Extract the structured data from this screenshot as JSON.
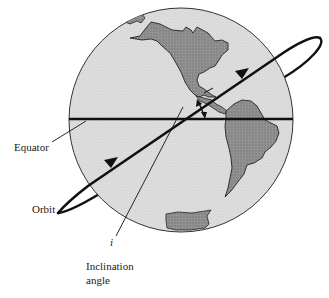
{
  "figure": {
    "type": "diagram",
    "labels": {
      "equator": "Equator",
      "orbit": "Orbit",
      "inclination_symbol": "i",
      "inclination_line1": "Inclination",
      "inclination_line2": "angle"
    },
    "caption": {
      "text": "",
      "note": "caption cut off at bottom edge, illegible"
    },
    "colors": {
      "background": "#ffffff",
      "globe_fill": "#dcdcdc",
      "land_fill": "#8a8a8a",
      "line": "#111111"
    },
    "elements": {
      "globe": {
        "cx": 181,
        "cy": 120,
        "r": 112
      },
      "equator_line": {
        "x1": 69,
        "y1": 119,
        "x2": 293,
        "y2": 119
      },
      "orbit_ellipse": {
        "cx": 189,
        "cy": 126,
        "rx": 158,
        "ry": 14,
        "rotation_deg": -33.7
      },
      "orbit_direction_arrows": 2,
      "inclination_marker": "double-headed arrow between orbit and equator"
    }
  }
}
